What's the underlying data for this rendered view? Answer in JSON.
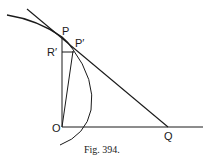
{
  "figure": {
    "caption": "Fig. 394.",
    "labels": {
      "P": "P",
      "P_prime": "P′",
      "R_prime": "R′",
      "O": "O",
      "Q": "Q"
    },
    "elements": [
      "curve through P",
      "tangent line at P meeting OQ at Q",
      "vertical line OP",
      "horizontal line OQ",
      "segment R′P′",
      "segment OP′",
      "arc through P′"
    ]
  }
}
